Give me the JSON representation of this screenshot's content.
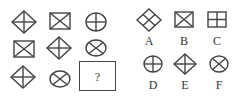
{
  "puzzle": {
    "grid": [
      {
        "row": 1,
        "cells": [
          {
            "shape": "diamond-cross"
          },
          {
            "shape": "rect-x"
          },
          {
            "shape": "circle-cross"
          }
        ]
      },
      {
        "row": 2,
        "cells": [
          {
            "shape": "rect-x"
          },
          {
            "shape": "diamond-cross"
          },
          {
            "shape": "ellipse-x"
          }
        ]
      },
      {
        "row": 3,
        "cells": [
          {
            "shape": "diamond-cross"
          },
          {
            "shape": "ellipse-x"
          },
          {
            "shape": "unknown"
          }
        ]
      }
    ],
    "question_mark": "?",
    "options": [
      {
        "label": "A",
        "shape": "diamond-cross-rotated"
      },
      {
        "label": "B",
        "shape": "rect-x"
      },
      {
        "label": "C",
        "shape": "rect-cross"
      },
      {
        "label": "D",
        "shape": "circle-cross"
      },
      {
        "label": "E",
        "shape": "diamond-cross"
      },
      {
        "label": "F",
        "shape": "ellipse-x"
      }
    ],
    "stroke_color": "#444444"
  }
}
